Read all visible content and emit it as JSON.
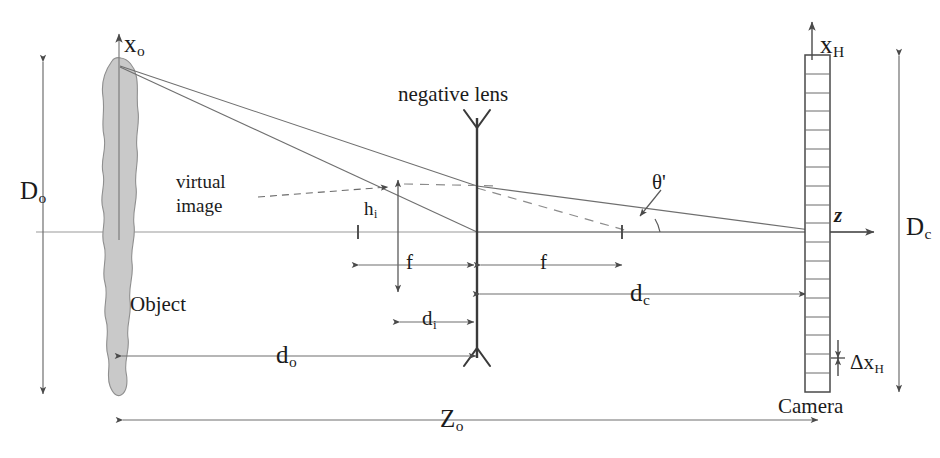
{
  "figure": {
    "domain": "optics-ray-diagram",
    "title_text": "negative lens",
    "background_color": "#ffffff",
    "ink_color": "#4a4a4a",
    "text_color": "#1b1b1b",
    "object_fill_color": "#c9c9c9",
    "object_stroke_color": "#8f8f8f"
  },
  "labels": {
    "x_o": {
      "base": "x",
      "sub": "o"
    },
    "D_o": {
      "base": "D",
      "sub": "o"
    },
    "object": {
      "base": "Object",
      "sub": ""
    },
    "negative_lens": {
      "base": "negative lens",
      "sub": ""
    },
    "virtual_line1": {
      "base": "virtual",
      "sub": ""
    },
    "virtual_line2": {
      "base": "image",
      "sub": ""
    },
    "h_i": {
      "base": "h",
      "sub": "i"
    },
    "f_left": {
      "base": "f",
      "sub": ""
    },
    "f_right": {
      "base": "f",
      "sub": ""
    },
    "d_i": {
      "base": "d",
      "sub": "i"
    },
    "d_o": {
      "base": "d",
      "sub": "o"
    },
    "d_c": {
      "base": "d",
      "sub": "c"
    },
    "theta_prime": {
      "base": "θ'",
      "sub": ""
    },
    "z_axis": {
      "base": "z",
      "sub": ""
    },
    "x_H": {
      "base": "x",
      "sub": "H"
    },
    "D_c": {
      "base": "D",
      "sub": "c"
    },
    "delta_x_H": {
      "base": "Δx",
      "sub": "H"
    },
    "camera": {
      "base": "Camera",
      "sub": ""
    },
    "Z_o": {
      "base": "Z",
      "sub": "o"
    }
  },
  "geometry": {
    "optical_axis_y": 232,
    "object_x": 115,
    "object_top_y": 60,
    "object_bottom_y": 395,
    "lens_x": 477,
    "lens_top_y": 118,
    "lens_bottom_y": 358,
    "virtual_image_x": 398,
    "virtual_image_top_y": 185,
    "focal_left_x": 358,
    "focal_right_x": 622,
    "camera_x_left": 805,
    "camera_x_right": 830,
    "camera_top_y": 55,
    "camera_bottom_y": 392,
    "camera_cell_count": 18
  },
  "camera_cells": [
    1,
    2,
    3,
    4,
    5,
    6,
    7,
    8,
    9,
    10,
    11,
    12,
    13,
    14,
    15,
    16,
    17,
    18
  ]
}
